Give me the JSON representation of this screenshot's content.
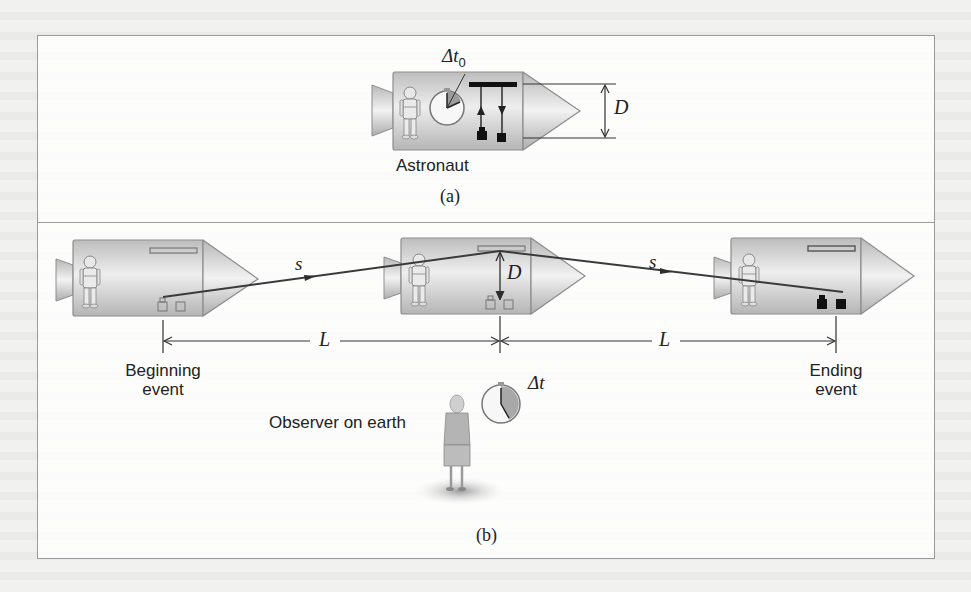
{
  "panel_a": {
    "caption": "(a)",
    "astronaut_label": "Astronaut",
    "clock_symbol": "Δt",
    "clock_subscript": "0",
    "distance_symbol": "D"
  },
  "panel_b": {
    "caption": "(b)",
    "path_symbol_left": "s",
    "path_symbol_right": "s",
    "distance_symbol": "D",
    "length_symbol_left": "L",
    "length_symbol_right": "L",
    "beginning_event_label": [
      "Beginning",
      "event"
    ],
    "ending_event_label": [
      "Ending",
      "event"
    ],
    "observer_label": "Observer on earth",
    "clock_symbol": "Δt"
  },
  "colors": {
    "rocket_body": "#c9c9c9",
    "rocket_outline": "#8d8d8d",
    "light_path": "#3a3a3a",
    "frame": "#9a9a9a"
  }
}
